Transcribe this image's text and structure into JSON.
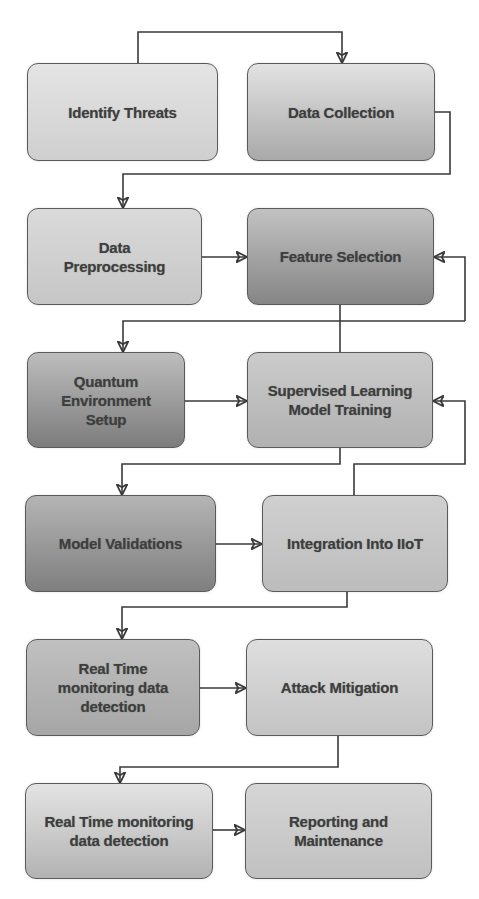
{
  "diagram": {
    "type": "flowchart",
    "nodes": [
      {
        "id": "n1",
        "label": "Identify Threats",
        "color_top": "#e4e4e4",
        "color_bottom": "#cfcfcf"
      },
      {
        "id": "n2",
        "label": "Data Collection",
        "color_top": "#e2e2e2",
        "color_bottom": "#a9a9a9"
      },
      {
        "id": "n3",
        "label": "Data\nPreprocessing",
        "color_top": "#dadada",
        "color_bottom": "#c6c6c6"
      },
      {
        "id": "n4",
        "label": "Feature Selection",
        "color_top": "#c2c2c2",
        "color_bottom": "#858585"
      },
      {
        "id": "n5",
        "label": "Quantum\nEnvironment\nSetup",
        "color_top": "#bdbdbd",
        "color_bottom": "#7c7c7c"
      },
      {
        "id": "n6",
        "label": "Supervised Learning\nModel Training",
        "color_top": "#cbcbcb",
        "color_bottom": "#b1b1b1"
      },
      {
        "id": "n7",
        "label": "Model Validations",
        "color_top": "#b4b4b4",
        "color_bottom": "#7f7f7f"
      },
      {
        "id": "n8",
        "label": "Integration Into IIoT",
        "color_top": "#d0d0d0",
        "color_bottom": "#bcbcbc"
      },
      {
        "id": "n9",
        "label": "Real Time\nmonitoring data\ndetection",
        "color_top": "#c0c0c0",
        "color_bottom": "#a6a6a6"
      },
      {
        "id": "n10",
        "label": "Attack Mitigation",
        "color_top": "#dedede",
        "color_bottom": "#c3c3c3"
      },
      {
        "id": "n11",
        "label": "Real Time monitoring\ndata detection",
        "color_top": "#e3e3e3",
        "color_bottom": "#b3b3b3"
      },
      {
        "id": "n12",
        "label": "Reporting and\nMaintenance",
        "color_top": "#d6d6d6",
        "color_bottom": "#c0c0c0"
      }
    ],
    "edges": [
      {
        "from": "Identify Threats",
        "to": "Data Collection"
      },
      {
        "from": "Data Collection",
        "to": "Data Preprocessing"
      },
      {
        "from": "Data Preprocessing",
        "to": "Feature Selection"
      },
      {
        "from": "Feature Selection",
        "to": "Quantum Environment Setup"
      },
      {
        "from": "Supervised Learning Model Training",
        "to": "Feature Selection"
      },
      {
        "from": "Quantum Environment Setup",
        "to": "Supervised Learning Model Training"
      },
      {
        "from": "Supervised Learning Model Training",
        "to": "Model Validations"
      },
      {
        "from": "Integration Into IIoT",
        "to": "Supervised Learning Model Training"
      },
      {
        "from": "Model Validations",
        "to": "Integration Into IIoT"
      },
      {
        "from": "Integration Into IIoT",
        "to": "Real Time monitoring data detection"
      },
      {
        "from": "Real Time monitoring data detection",
        "to": "Attack Mitigation"
      },
      {
        "from": "Attack Mitigation",
        "to": "Real Time monitoring data detection (2)"
      },
      {
        "from": "Real Time monitoring data detection (2)",
        "to": "Reporting and Maintenance"
      }
    ],
    "line_color": "#3a3a3a",
    "text_color": "#3e3e3e",
    "border_color": "#5a5a5a"
  }
}
